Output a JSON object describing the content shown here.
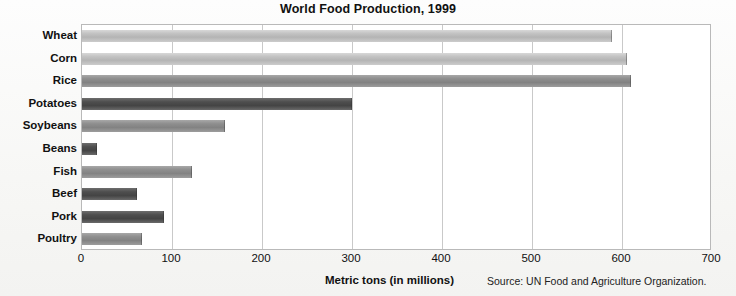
{
  "chart_data": {
    "type": "bar",
    "orientation": "horizontal",
    "title": "World Food Production, 1999",
    "xlabel": "Metric tons (in millions)",
    "ylabel": "",
    "xlim": [
      0,
      700
    ],
    "xticks": [
      0,
      100,
      200,
      300,
      400,
      500,
      600,
      700
    ],
    "grid": true,
    "legend": null,
    "source": "Source: UN Food and Agriculture Organization.",
    "categories": [
      "Wheat",
      "Corn",
      "Rice",
      "Potatoes",
      "Soybeans",
      "Beans",
      "Fish",
      "Beef",
      "Pork",
      "Poultry"
    ],
    "values": [
      589,
      605,
      610,
      300,
      159,
      17,
      122,
      61,
      91,
      67
    ],
    "bar_shades": [
      "light",
      "light",
      "mid",
      "dark",
      "mid",
      "dark",
      "mid",
      "dark",
      "dark",
      "mid"
    ],
    "colors": {
      "light": "#c2c2c2",
      "mid": "#8f8f8f",
      "dark": "#4e4e4e",
      "gridline": "#c9c9c9",
      "frame": "#b9b9b9",
      "text": "#111111"
    }
  }
}
